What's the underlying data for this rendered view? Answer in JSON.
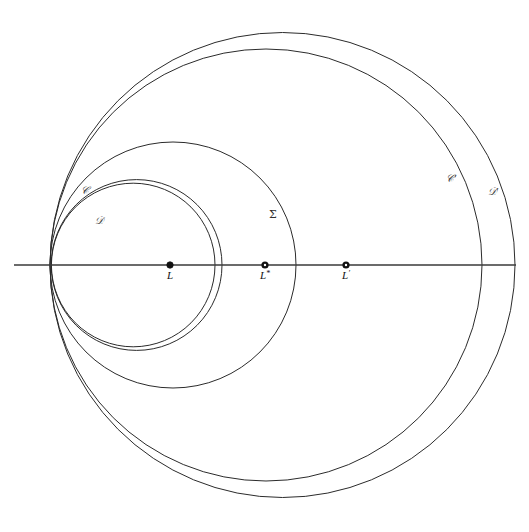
{
  "figure": {
    "background_color": "#ffffff",
    "stroke_color": "#2b2b2b",
    "axis_color": "#3a3a3a",
    "width": 529,
    "height": 532
  },
  "axis": {
    "name": "horizontal-axis",
    "y": 265,
    "x_start": 14,
    "x_end": 516
  },
  "radical_points": [
    {
      "x": 57,
      "y": 196
    },
    {
      "x": 57,
      "y": 333
    }
  ],
  "points": [
    {
      "id": "L",
      "label": "L",
      "superscript": "",
      "x": 170,
      "y": 265,
      "marker": "filled",
      "label_dx": 0,
      "label_dy": 14
    },
    {
      "id": "L-star",
      "label": "L",
      "superscript": "*",
      "x": 265,
      "y": 265,
      "marker": "ring",
      "label_dx": 0,
      "label_dy": 14
    },
    {
      "id": "L-prime",
      "label": "L",
      "superscript": "′",
      "x": 346,
      "y": 265,
      "marker": "ring",
      "label_dx": 0,
      "label_dy": 14
    }
  ],
  "circles": [
    {
      "id": "circle-D",
      "label": "𝒟",
      "label_x": 99,
      "label_y": 224,
      "cx": 136.6,
      "cy": 265,
      "r": 85.4,
      "right_intercept": 222,
      "left_intercept": 51.2
    },
    {
      "id": "circle-C",
      "label": "𝒞",
      "label_x": 85,
      "label_y": 194,
      "cx": 133.2,
      "cy": 265,
      "r": 81.8,
      "right_intercept": 215,
      "left_intercept": 51.4
    },
    {
      "id": "circle-Sigma",
      "label": "Σ",
      "label_x": 273,
      "label_y": 218,
      "cx": 173.0,
      "cy": 265,
      "r": 123.0,
      "right_intercept": 296,
      "left_intercept": 50.0
    },
    {
      "id": "circle-C-prime",
      "label": "𝒞′",
      "label_x": 451,
      "label_y": 182,
      "cx": 266.0,
      "cy": 265,
      "r": 216.0,
      "right_intercept": 482,
      "left_intercept": 50.0
    },
    {
      "id": "circle-D-prime",
      "label": "𝒟′",
      "label_x": 493,
      "label_y": 195,
      "cx": 282.5,
      "cy": 265,
      "r": 232.5,
      "right_intercept": 515,
      "left_intercept": 50.0
    }
  ],
  "labels": {
    "curve_labels": [
      "𝒞",
      "𝒟",
      "Σ",
      "𝒞′",
      "𝒟′"
    ],
    "point_labels": [
      "L",
      "L*",
      "L′"
    ]
  }
}
